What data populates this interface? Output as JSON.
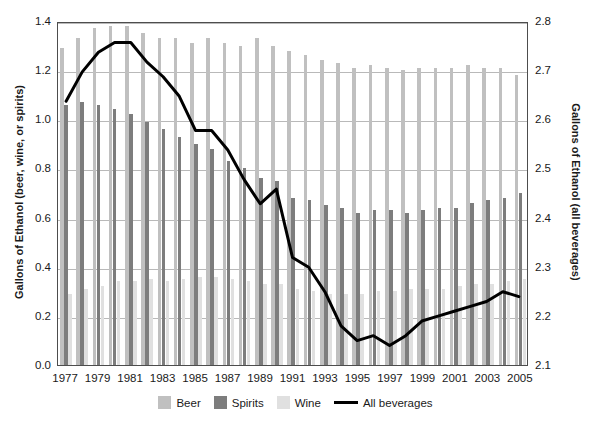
{
  "chart_data": {
    "type": "bar",
    "title": "",
    "subtitle": "",
    "xlabel": "",
    "ylabel": "Gallons of Ethanol (beer, wine, or spirits)",
    "ylabel_right": "Gallons of Ethanol (all beverages)",
    "ylim": [
      0.0,
      1.4
    ],
    "ylim_right": [
      2.1,
      2.8
    ],
    "yticks": [
      "0.0",
      "0.2",
      "0.4",
      "0.6",
      "0.8",
      "1.0",
      "1.2",
      "1.4"
    ],
    "ytick_values": [
      0.0,
      0.2,
      0.4,
      0.6,
      0.8,
      1.0,
      1.2,
      1.4
    ],
    "yticks_right": [
      "2.1",
      "2.2",
      "2.3",
      "2.4",
      "2.5",
      "2.6",
      "2.7",
      "2.8"
    ],
    "ytick_values_right": [
      2.1,
      2.2,
      2.3,
      2.4,
      2.5,
      2.6,
      2.7,
      2.8
    ],
    "grid": true,
    "legend_position": "bottom",
    "x": [
      1977,
      1978,
      1979,
      1980,
      1981,
      1982,
      1983,
      1984,
      1985,
      1986,
      1987,
      1988,
      1989,
      1990,
      1991,
      1992,
      1993,
      1994,
      1995,
      1996,
      1997,
      1998,
      1999,
      2000,
      2001,
      2002,
      2003,
      2004,
      2005
    ],
    "categories": [
      "1977",
      "1978",
      "1979",
      "1980",
      "1981",
      "1982",
      "1983",
      "1984",
      "1985",
      "1986",
      "1987",
      "1988",
      "1989",
      "1990",
      "1991",
      "1992",
      "1993",
      "1994",
      "1995",
      "1996",
      "1997",
      "1998",
      "1999",
      "2000",
      "2001",
      "2002",
      "2003",
      "2004",
      "2005"
    ],
    "xtick_labels": [
      "1977",
      "1979",
      "1981",
      "1983",
      "1985",
      "1987",
      "1989",
      "1991",
      "1993",
      "1995",
      "1997",
      "1999",
      "2001",
      "2003",
      "2005"
    ],
    "series": [
      {
        "name": "Beer",
        "type": "bar",
        "color": "#c0c0c0",
        "axis": "left",
        "values": [
          1.29,
          1.33,
          1.37,
          1.38,
          1.38,
          1.35,
          1.33,
          1.33,
          1.31,
          1.33,
          1.31,
          1.3,
          1.33,
          1.3,
          1.28,
          1.26,
          1.24,
          1.23,
          1.21,
          1.22,
          1.21,
          1.2,
          1.21,
          1.21,
          1.21,
          1.22,
          1.21,
          1.21,
          1.18
        ]
      },
      {
        "name": "Spirits",
        "type": "bar",
        "color": "#7d7d7d",
        "axis": "left",
        "values": [
          1.06,
          1.07,
          1.06,
          1.04,
          1.02,
          0.99,
          0.96,
          0.93,
          0.9,
          0.88,
          0.83,
          0.8,
          0.76,
          0.75,
          0.68,
          0.67,
          0.65,
          0.64,
          0.62,
          0.63,
          0.63,
          0.62,
          0.63,
          0.64,
          0.64,
          0.66,
          0.67,
          0.68,
          0.7
        ]
      },
      {
        "name": "Wine",
        "type": "bar",
        "color": "#e0e0e0",
        "axis": "left",
        "values": [
          0.29,
          0.31,
          0.32,
          0.34,
          0.34,
          0.35,
          0.34,
          0.35,
          0.36,
          0.36,
          0.35,
          0.34,
          0.33,
          0.33,
          0.31,
          0.3,
          0.29,
          0.29,
          0.29,
          0.3,
          0.3,
          0.31,
          0.31,
          0.31,
          0.32,
          0.33,
          0.33,
          0.34,
          0.35
        ]
      },
      {
        "name": "All beverages",
        "type": "line",
        "color": "#000000",
        "axis": "right",
        "values": [
          2.64,
          2.7,
          2.74,
          2.76,
          2.76,
          2.72,
          2.69,
          2.65,
          2.58,
          2.58,
          2.54,
          2.48,
          2.43,
          2.46,
          2.32,
          2.3,
          2.25,
          2.18,
          2.15,
          2.16,
          2.14,
          2.16,
          2.19,
          2.2,
          2.21,
          2.22,
          2.23,
          2.25,
          2.24
        ]
      }
    ],
    "legend": [
      "Beer",
      "Spirits",
      "Wine",
      "All beverages"
    ]
  },
  "legend": {
    "beer": "Beer",
    "spirits": "Spirits",
    "wine": "Wine",
    "all": "All beverages"
  },
  "axes": {
    "left_title": "Gallons of Ethanol (beer, wine, or spirits)",
    "right_title": "Gallons of Ethanol (all beverages)"
  },
  "colors": {
    "beer": "#c0c0c0",
    "spirits": "#7d7d7d",
    "wine": "#e0e0e0",
    "line": "#000000",
    "grid": "#b9b9b9",
    "frame": "#4d4d4d"
  }
}
